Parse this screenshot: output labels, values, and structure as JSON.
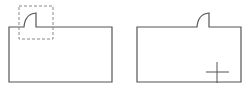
{
  "diagram": {
    "colors": {
      "stroke": "#555555",
      "dashed": "#888888",
      "background": "#ffffff"
    },
    "panels": [
      {
        "name": "before",
        "has_selection_box": true,
        "has_cursor": false
      },
      {
        "name": "after",
        "has_selection_box": false,
        "has_cursor": true
      }
    ]
  }
}
